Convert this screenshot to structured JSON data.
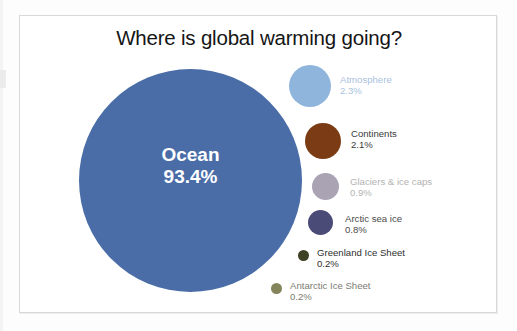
{
  "chart_data": {
    "type": "pie",
    "title": "Where is global warming going?",
    "subtitle": "",
    "xlabel": "",
    "ylabel": "",
    "legend_position": "right",
    "grid": false,
    "categories": [
      "Ocean",
      "Atmosphere",
      "Continents",
      "Glaciers & ice caps",
      "Arctic sea ice",
      "Greenland Ice Sheet",
      "Antarctic Ice Sheet"
    ],
    "values": [
      93.4,
      2.3,
      2.1,
      0.9,
      0.8,
      0.2,
      0.2
    ],
    "value_labels": [
      "93.4%",
      "2.3%",
      "2.1%",
      "0.9%",
      "0.8%",
      "0.2%",
      "0.2%"
    ],
    "unit": "%",
    "colors": [
      "#4a6da7",
      "#8fb5dc",
      "#7a3b15",
      "#a9a3b4",
      "#4b4b78",
      "#3e4124",
      "#85855c"
    ]
  },
  "title": "Where is global warming going?",
  "main_bubble": {
    "label": "Ocean",
    "percent": "93.4%",
    "color": "#4a6da7"
  },
  "legend": {
    "items": [
      {
        "name": "Atmosphere",
        "percent": "2.3%",
        "color": "#8fb5dc"
      },
      {
        "name": "Continents",
        "percent": "2.1%",
        "color": "#7a3b15"
      },
      {
        "name": "Glaciers & ice caps",
        "percent": "0.9%",
        "color": "#a9a3b4"
      },
      {
        "name": "Arctic sea ice",
        "percent": "0.8%",
        "color": "#4b4b78"
      },
      {
        "name": "Greenland Ice Sheet",
        "percent": "0.2%",
        "color": "#3e4124"
      },
      {
        "name": "Antarctic Ice Sheet",
        "percent": "0.2%",
        "color": "#85855c"
      }
    ]
  }
}
